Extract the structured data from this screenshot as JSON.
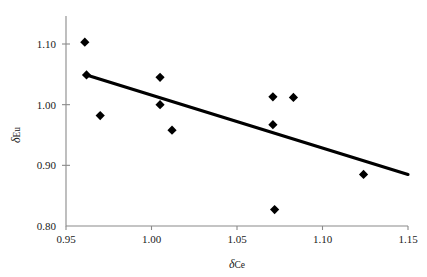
{
  "chart_data": {
    "type": "scatter",
    "title": "",
    "xlabel": "δCe",
    "ylabel": "δEu",
    "xlim": [
      0.95,
      1.15
    ],
    "ylim": [
      0.8,
      1.1
    ],
    "grid": false,
    "legend": null,
    "x_ticks": [
      "0.95",
      "1.00",
      "1.05",
      "1.10",
      "1.15"
    ],
    "x_tick_values": [
      0.95,
      1.0,
      1.05,
      1.1,
      1.15
    ],
    "y_ticks": [
      "0.80",
      "0.90",
      "1.00",
      "1.10"
    ],
    "y_tick_values": [
      0.8,
      0.9,
      1.0,
      1.1
    ],
    "marker": "diamond",
    "marker_color": "#000000",
    "points": [
      {
        "x": 0.961,
        "y": 1.103
      },
      {
        "x": 0.962,
        "y": 1.049
      },
      {
        "x": 0.97,
        "y": 0.982
      },
      {
        "x": 1.005,
        "y": 1.045
      },
      {
        "x": 1.005,
        "y": 1.0
      },
      {
        "x": 1.012,
        "y": 0.958
      },
      {
        "x": 1.071,
        "y": 1.013
      },
      {
        "x": 1.083,
        "y": 1.012
      },
      {
        "x": 1.071,
        "y": 0.967
      },
      {
        "x": 1.072,
        "y": 0.827
      },
      {
        "x": 1.124,
        "y": 0.885
      }
    ],
    "trendline": {
      "type": "linear",
      "color": "#000000",
      "x0": 0.962,
      "y0": 1.049,
      "x1": 1.15,
      "y1": 0.885
    }
  },
  "axes": {
    "x_title_symbol": "δ",
    "x_title_text": "Ce",
    "y_title_symbol": "δ",
    "y_title_text": "Eu"
  }
}
